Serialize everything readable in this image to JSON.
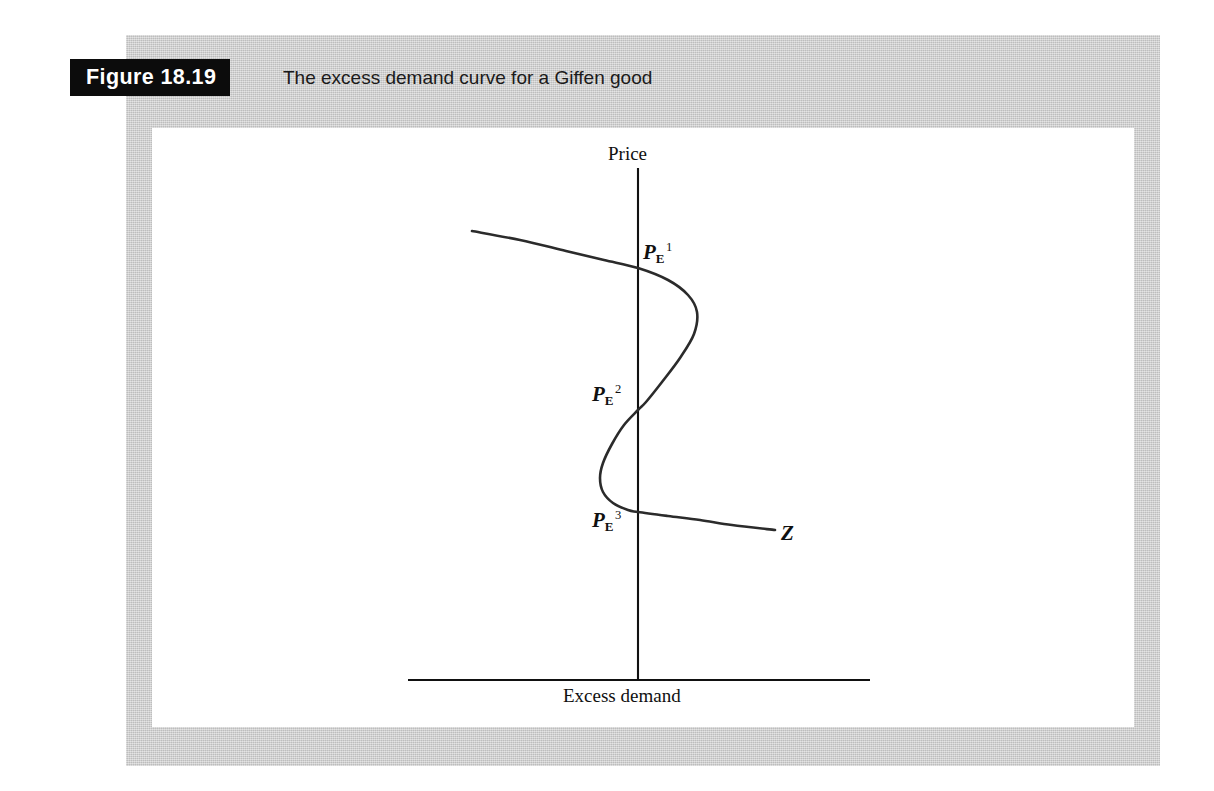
{
  "figure": {
    "number_label": "Figure 18.19",
    "caption": "The excess demand curve for a Giffen good",
    "banner_background": "#0c0c0c",
    "banner_text_color": "#ffffff",
    "page_tint": "#cacaca"
  },
  "axes": {
    "y_title": "Price",
    "x_title": "Excess demand"
  },
  "annotations": {
    "pe1": {
      "base": "P",
      "sub": "E",
      "sup": "1"
    },
    "pe2": {
      "base": "P",
      "sub": "E",
      "sup": "2"
    },
    "pe3": {
      "base": "P",
      "sub": "E",
      "sup": "3"
    },
    "curve_name": "Z"
  },
  "chart_data": {
    "type": "line",
    "title": "The excess demand curve for a Giffen good",
    "xlabel": "Excess demand",
    "ylabel": "Price",
    "grid": false,
    "legend": null,
    "axis_origin_px": {
      "x": 638,
      "y": 680
    },
    "x_axis_extent_px": [
      408,
      870
    ],
    "y_axis_extent_px": [
      168,
      680
    ],
    "series": [
      {
        "name": "Z",
        "description": "Backward-bending S-shaped excess demand curve crossing the price axis at three equilibria",
        "points_px": [
          [
            472,
            231
          ],
          [
            520,
            240
          ],
          [
            566,
            251
          ],
          [
            604,
            260
          ],
          [
            638,
            268
          ],
          [
            668,
            280
          ],
          [
            688,
            295
          ],
          [
            697,
            312
          ],
          [
            694,
            334
          ],
          [
            680,
            358
          ],
          [
            662,
            382
          ],
          [
            646,
            402
          ],
          [
            638,
            410
          ],
          [
            624,
            425
          ],
          [
            612,
            444
          ],
          [
            603,
            463
          ],
          [
            600,
            478
          ],
          [
            603,
            492
          ],
          [
            613,
            503
          ],
          [
            628,
            510
          ],
          [
            638,
            512
          ],
          [
            668,
            516
          ],
          [
            700,
            520
          ],
          [
            732,
            525
          ],
          [
            775,
            530
          ]
        ]
      }
    ],
    "equilibria": [
      {
        "label": "P_E^1",
        "axis_crossing_px": [
          638,
          268
        ],
        "excess_demand": 0,
        "stability": "intersection with price axis"
      },
      {
        "label": "P_E^2",
        "axis_crossing_px": [
          638,
          410
        ],
        "excess_demand": 0,
        "stability": "intersection with price axis"
      },
      {
        "label": "P_E^3",
        "axis_crossing_px": [
          638,
          512
        ],
        "excess_demand": 0,
        "stability": "intersection with price axis"
      }
    ],
    "annotations": [
      {
        "text": "Z",
        "position_px": [
          781,
          521
        ],
        "note": "curve label at right end"
      }
    ]
  }
}
